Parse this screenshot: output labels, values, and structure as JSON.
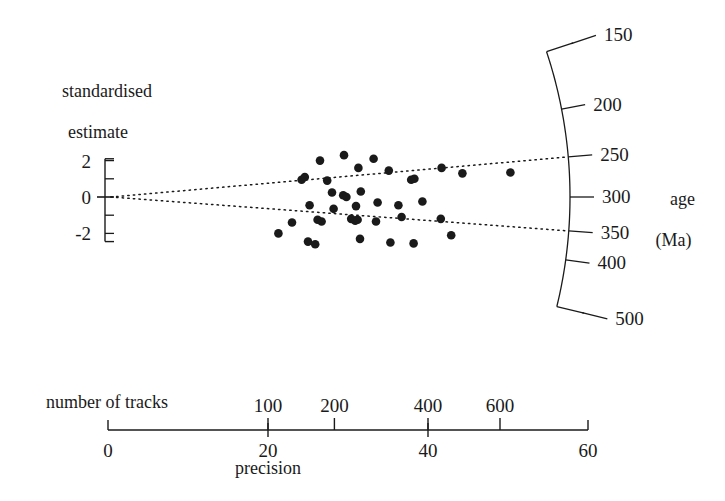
{
  "figure": {
    "type": "radial-plot",
    "width": 725,
    "height": 501,
    "background": "#ffffff",
    "ink_color": "#1a1a1a"
  },
  "labels": {
    "y_axis_title_line1": "standardised",
    "y_axis_title_line2": "estimate",
    "right_axis_title_line1": "age",
    "right_axis_title_line2": "(Ma)",
    "top_axis_title": "number of tracks",
    "bottom_axis_title": "precision"
  },
  "chart_data": {
    "type": "scatter",
    "title": "",
    "subtitle": "",
    "xlabel": "precision",
    "ylabel": "standardised estimate",
    "secondary_xlabel": "number of tracks",
    "secondary_ylabel": "age (Ma)",
    "grid": false,
    "legend": null,
    "x_axis": {
      "label": "precision",
      "ticks": [
        0,
        20,
        40,
        60
      ],
      "tick_labels": [
        "0",
        "20",
        "40",
        "60"
      ],
      "xlim": [
        0,
        60
      ]
    },
    "secondary_x_axis": {
      "label": "number of tracks",
      "ticks": [
        100,
        200,
        400,
        600
      ],
      "tick_labels": [
        "100",
        "200",
        "400",
        "600"
      ],
      "tick_precision_positions": [
        20.0,
        28.3,
        40.0,
        49.0
      ]
    },
    "y_axis": {
      "label": "standardised estimate",
      "ticks": [
        2,
        1,
        0,
        -1,
        -2
      ],
      "tick_labels": [
        "2",
        "",
        "0",
        "",
        "-2"
      ],
      "ylim": [
        -2.9,
        2.9
      ]
    },
    "radial_axis": {
      "label": "age (Ma)",
      "ticks": [
        500,
        400,
        350,
        300,
        250,
        200,
        150
      ],
      "tick_labels": [
        "500",
        "400",
        "350",
        "300",
        "250",
        "200",
        "150"
      ],
      "central_value": 300
    },
    "reference_lines": [
      {
        "name": "upper-dotted-line",
        "style": "dotted",
        "from_value": 0,
        "to_value": 350
      },
      {
        "name": "lower-dotted-line",
        "style": "dotted",
        "from_value": 0,
        "to_value": 250
      }
    ],
    "points": [
      {
        "x": 26.5,
        "y": 2.0
      },
      {
        "x": 29.5,
        "y": 2.3
      },
      {
        "x": 31.3,
        "y": 1.6
      },
      {
        "x": 33.2,
        "y": 2.1
      },
      {
        "x": 27.4,
        "y": 0.9
      },
      {
        "x": 24.2,
        "y": 0.95
      },
      {
        "x": 24.6,
        "y": 1.1
      },
      {
        "x": 28.0,
        "y": 0.25
      },
      {
        "x": 29.4,
        "y": 0.1
      },
      {
        "x": 29.8,
        "y": 0.0
      },
      {
        "x": 31.6,
        "y": 0.3
      },
      {
        "x": 35.1,
        "y": 1.45
      },
      {
        "x": 37.9,
        "y": 0.95
      },
      {
        "x": 38.3,
        "y": 1.0
      },
      {
        "x": 41.7,
        "y": 1.6
      },
      {
        "x": 44.3,
        "y": 1.3
      },
      {
        "x": 50.3,
        "y": 1.35
      },
      {
        "x": 25.2,
        "y": -0.45
      },
      {
        "x": 28.2,
        "y": -0.65
      },
      {
        "x": 31.0,
        "y": -0.5
      },
      {
        "x": 33.7,
        "y": -0.3
      },
      {
        "x": 36.3,
        "y": -0.45
      },
      {
        "x": 39.3,
        "y": -0.25
      },
      {
        "x": 23.0,
        "y": -1.4
      },
      {
        "x": 26.2,
        "y": -1.25
      },
      {
        "x": 26.7,
        "y": -1.35
      },
      {
        "x": 30.4,
        "y": -1.2
      },
      {
        "x": 30.9,
        "y": -1.3
      },
      {
        "x": 31.2,
        "y": -1.25
      },
      {
        "x": 33.5,
        "y": -1.35
      },
      {
        "x": 36.7,
        "y": -1.1
      },
      {
        "x": 41.6,
        "y": -1.2
      },
      {
        "x": 21.3,
        "y": -2.0
      },
      {
        "x": 25.0,
        "y": -2.45
      },
      {
        "x": 25.9,
        "y": -2.6
      },
      {
        "x": 31.5,
        "y": -2.3
      },
      {
        "x": 35.3,
        "y": -2.5
      },
      {
        "x": 38.2,
        "y": -2.55
      },
      {
        "x": 42.9,
        "y": -2.1
      }
    ]
  }
}
